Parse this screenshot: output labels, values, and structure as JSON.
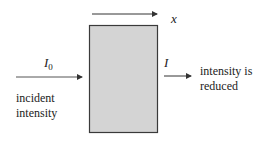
{
  "diagram": {
    "type": "beer-lambert-absorption",
    "colors": {
      "sample_fill": "#d4d4d4",
      "sample_border": "#3a3a3a",
      "arrow": "#333333",
      "text": "#222222"
    },
    "sample_box": {
      "x": 89,
      "y": 25,
      "width": 69,
      "height": 108
    },
    "path_arrow": {
      "label": "x",
      "x1": 92,
      "x2": 157,
      "y": 14
    },
    "incident_arrow": {
      "label_main": "I",
      "label_sub": "0",
      "x1": 16,
      "x2": 82,
      "y": 77
    },
    "transmitted_arrow": {
      "label": "I",
      "x1": 164,
      "x2": 191,
      "y": 76
    },
    "incident_text": {
      "line1": "incident",
      "line2": "intensity"
    },
    "transmitted_text": {
      "line1": "intensity is",
      "line2": "reduced"
    }
  }
}
